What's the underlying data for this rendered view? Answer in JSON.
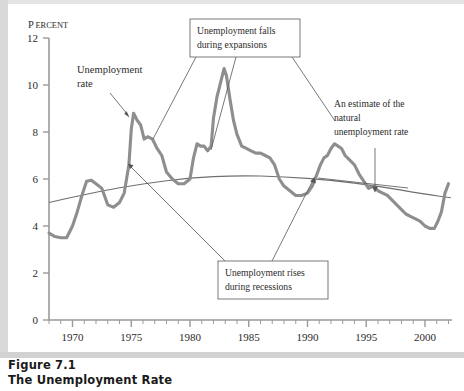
{
  "figure": {
    "number_label": "Figure 7.1",
    "title": "The Unemployment Rate"
  },
  "chart_data": {
    "type": "line",
    "title": "The Unemployment Rate",
    "xlabel": "",
    "ylabel": "PERCENT",
    "ylabel_first_letter": "P",
    "ylabel_rest": "ERCENT",
    "xlim": [
      1968,
      2002.3
    ],
    "ylim": [
      0,
      12
    ],
    "grid": false,
    "legend": "none",
    "y_ticks": [
      "12",
      "10",
      "8",
      "6",
      "4",
      "2",
      "0"
    ],
    "y_tick_values": [
      12,
      10,
      8,
      6,
      4,
      2,
      0
    ],
    "x_ticks": [
      "1970",
      "1975",
      "1980",
      "1985",
      "1990",
      "1995",
      "2000"
    ],
    "x_tick_values": [
      1970,
      1975,
      1980,
      1985,
      1990,
      1995,
      2000
    ],
    "x_minor_step": 1,
    "line_color": "#8e8e8e",
    "natural_rate_color": "#6f6f6f",
    "series": [
      {
        "name": "Unemployment rate",
        "color": "#8e8e8e",
        "x": [
          1968.0,
          1968.5,
          1969.0,
          1969.5,
          1970.0,
          1970.4,
          1970.8,
          1971.2,
          1971.6,
          1972.0,
          1972.5,
          1973.0,
          1973.5,
          1974.0,
          1974.4,
          1974.8,
          1975.0,
          1975.2,
          1975.5,
          1975.8,
          1976.1,
          1976.4,
          1976.8,
          1977.2,
          1977.6,
          1978.0,
          1978.5,
          1979.0,
          1979.5,
          1980.0,
          1980.3,
          1980.6,
          1980.9,
          1981.2,
          1981.5,
          1981.8,
          1982.0,
          1982.3,
          1982.6,
          1982.9,
          1983.1,
          1983.4,
          1983.7,
          1984.0,
          1984.4,
          1984.8,
          1985.2,
          1985.6,
          1986.0,
          1986.4,
          1986.8,
          1987.2,
          1987.6,
          1988.0,
          1988.5,
          1989.0,
          1989.5,
          1990.0,
          1990.4,
          1990.8,
          1991.1,
          1991.4,
          1991.7,
          1992.0,
          1992.3,
          1992.6,
          1992.9,
          1993.2,
          1993.6,
          1994.0,
          1994.4,
          1994.8,
          1995.2,
          1995.6,
          1996.0,
          1996.4,
          1996.8,
          1997.2,
          1997.6,
          1998.0,
          1998.4,
          1998.8,
          1999.2,
          1999.6,
          2000.0,
          2000.4,
          2000.8,
          2001.1,
          2001.4,
          2001.7,
          2002.0
        ],
        "y": [
          3.7,
          3.55,
          3.5,
          3.5,
          4.0,
          4.6,
          5.3,
          5.9,
          5.95,
          5.8,
          5.6,
          4.9,
          4.8,
          5.0,
          5.4,
          6.6,
          8.1,
          8.8,
          8.5,
          8.3,
          7.7,
          7.8,
          7.7,
          7.3,
          7.0,
          6.3,
          6.0,
          5.8,
          5.8,
          6.0,
          6.9,
          7.5,
          7.4,
          7.4,
          7.2,
          7.4,
          8.6,
          9.5,
          10.1,
          10.7,
          10.4,
          9.4,
          8.5,
          7.9,
          7.4,
          7.3,
          7.2,
          7.1,
          7.1,
          7.0,
          6.9,
          6.6,
          6.0,
          5.7,
          5.5,
          5.3,
          5.3,
          5.4,
          5.7,
          6.2,
          6.6,
          6.9,
          7.0,
          7.3,
          7.5,
          7.4,
          7.3,
          7.0,
          6.8,
          6.6,
          6.2,
          5.9,
          5.6,
          5.7,
          5.5,
          5.4,
          5.3,
          5.1,
          4.9,
          4.7,
          4.5,
          4.4,
          4.3,
          4.2,
          4.0,
          3.9,
          3.9,
          4.2,
          4.6,
          5.4,
          5.8
        ]
      },
      {
        "name": "An estimate of the natural unemployment rate",
        "color": "#6f6f6f",
        "x": [
          1968,
          1972,
          1976,
          1980,
          1984,
          1988,
          1992,
          1996,
          2000,
          2002.2
        ],
        "y": [
          5.0,
          5.45,
          5.8,
          6.05,
          6.15,
          6.1,
          5.95,
          5.7,
          5.35,
          5.2
        ]
      }
    ],
    "annotations": [
      {
        "id": "unemployment-rate-label",
        "line1": "Unemployment",
        "line2": "rate",
        "boxed": false
      },
      {
        "id": "expansions-note",
        "line1": "Unemployment falls",
        "line2": "during expansions",
        "boxed": true
      },
      {
        "id": "natural-rate-note",
        "line1": "An estimate of the",
        "line2": "natural",
        "line3": "unemployment rate",
        "boxed": false
      },
      {
        "id": "recessions-note",
        "line1": "Unemployment rises",
        "line2": "during recessions",
        "boxed": true
      }
    ]
  }
}
